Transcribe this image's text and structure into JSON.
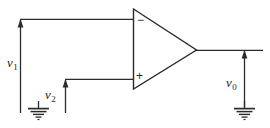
{
  "diagram": {
    "type": "schematic",
    "canvas": {
      "width": 270,
      "height": 128
    },
    "ink_color": "#2b2b2b",
    "background_color": "#ffffff",
    "labels": {
      "v1": {
        "base": "v",
        "sub": "1"
      },
      "v2": {
        "base": "v",
        "sub": "2"
      },
      "v0": {
        "base": "v",
        "sub": "0"
      }
    },
    "terminals": {
      "inverting": "−",
      "noninverting": "+"
    },
    "nodes": [
      {
        "name": "v1-source",
        "label": "v1",
        "polarity": "arrow-up",
        "connects_to": "inverting-input"
      },
      {
        "name": "v2-source",
        "label": "v2",
        "polarity": "arrow-up",
        "connects_to": "noninverting-input"
      },
      {
        "name": "v0-output",
        "label": "v0",
        "polarity": "arrow-up",
        "connects_to": "amplifier-output"
      }
    ],
    "grounds": [
      {
        "name": "ground-left",
        "x": 38,
        "y": 107
      },
      {
        "name": "ground-right",
        "x": 244,
        "y": 107
      }
    ]
  }
}
